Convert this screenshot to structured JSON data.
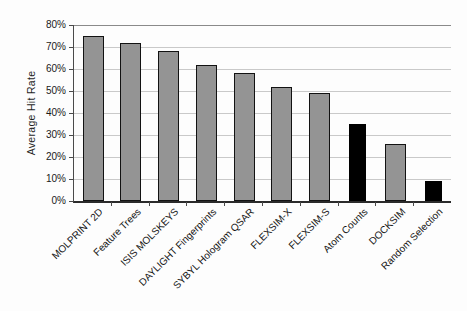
{
  "chart_data": {
    "type": "bar",
    "title": "",
    "xlabel": "",
    "ylabel": "Average Hit Rate",
    "ylim": [
      0,
      80
    ],
    "ytick_step": 10,
    "ytick_labels": [
      "80%",
      "70%",
      "60%",
      "50%",
      "40%",
      "30%",
      "20%",
      "10%",
      "0%"
    ],
    "grid": true,
    "legend": false,
    "categories": [
      "MOLPRINT 2D",
      "Feature Trees",
      "ISIS MOLSKEYS",
      "DAYLIGHT Fingerprints",
      "SYBYL Hologram QSAR",
      "FLEXSIM-X",
      "FLEXSIM-S",
      "Atom Counts",
      "DOCKSIM",
      "Random Selection"
    ],
    "values": [
      75,
      72,
      68,
      62,
      58,
      52,
      49,
      35,
      26,
      9
    ],
    "bar_styles": [
      "gray",
      "gray",
      "gray",
      "gray",
      "gray",
      "gray",
      "gray",
      "black",
      "gray",
      "black"
    ],
    "colors": {
      "gray": "#949494",
      "black": "#000000",
      "gridline": "#c9c9c9",
      "axis": "#2b2b2b"
    }
  }
}
